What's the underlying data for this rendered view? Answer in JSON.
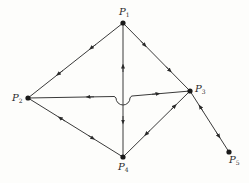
{
  "diagram": {
    "type": "directed graph with bidirectional edges",
    "nodes": [
      {
        "id": "P1",
        "label": "P",
        "sub": "1",
        "x": 123,
        "y": 23
      },
      {
        "id": "P2",
        "label": "P",
        "sub": "2",
        "x": 28,
        "y": 98
      },
      {
        "id": "P3",
        "label": "P",
        "sub": "3",
        "x": 190,
        "y": 91
      },
      {
        "id": "P4",
        "label": "P",
        "sub": "4",
        "x": 123,
        "y": 157
      },
      {
        "id": "P5",
        "label": "P",
        "sub": "5",
        "x": 229,
        "y": 152
      }
    ],
    "edges": [
      {
        "from": "P1",
        "to": "P2"
      },
      {
        "from": "P1",
        "to": "P3"
      },
      {
        "from": "P1",
        "to": "P4"
      },
      {
        "from": "P2",
        "to": "P3",
        "note": "crosses P1-P4 with a semicircular hop"
      },
      {
        "from": "P2",
        "to": "P4"
      },
      {
        "from": "P3",
        "to": "P4"
      },
      {
        "from": "P3",
        "to": "P5"
      }
    ],
    "colors": {
      "line": "#3a3a3a",
      "node": "#1a1a1a",
      "background": "#fdfdfb"
    }
  }
}
